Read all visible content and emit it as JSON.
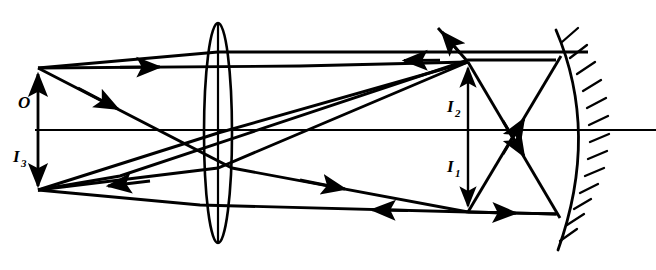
{
  "figure": {
    "kind": "optical-ray-diagram",
    "width": 656,
    "height": 270,
    "background_color": "#ffffff",
    "ink_color": "#000000"
  },
  "labels": [
    {
      "id": "object",
      "base": "O",
      "subscript": "",
      "x": 18,
      "y": 108,
      "description": "object arrow label above the optical axis at the far left"
    },
    {
      "id": "image3",
      "base": "I",
      "subscript": "3",
      "x": 13,
      "y": 162,
      "description": "final image label below the optical axis at the far left"
    },
    {
      "id": "image2",
      "base": "I",
      "subscript": "2",
      "x": 447,
      "y": 112,
      "description": "second image label above the optical axis near the mirror"
    },
    {
      "id": "image1",
      "base": "I",
      "subscript": "1",
      "x": 447,
      "y": 172,
      "description": "first image label below the optical axis near the mirror"
    }
  ],
  "optical_axis": {
    "name": "principal-axis",
    "x1": 35,
    "y1": 130,
    "x2": 656,
    "y2": 130
  },
  "lens": {
    "name": "converging-lens",
    "center_x": 218,
    "center_y": 133,
    "rx": 14,
    "ry": 110,
    "has_center_line": true,
    "shape": "biconvex"
  },
  "mirror": {
    "name": "concave-mirror",
    "shape": "arc",
    "path": "M 556 30 Q 600 133 558 250",
    "hatch_count": 13,
    "hatch_length": 15,
    "description": "concave mirror facing left, hatched on its back (right) side"
  },
  "elements": {
    "object_arrow": {
      "name": "object-arrow-O",
      "x": 38,
      "y_tail": 130,
      "y_tip": 68,
      "direction": "up"
    },
    "image3_arrow": {
      "name": "image-arrow-I3",
      "x": 38,
      "y_tail": 130,
      "y_tip": 190,
      "direction": "down"
    },
    "image2_arrow": {
      "name": "image-arrow-I2",
      "x": 468,
      "y_tail": 130,
      "y_tip": 62,
      "direction": "up"
    },
    "image1_arrow": {
      "name": "image-arrow-I1",
      "x": 468,
      "y_tail": 130,
      "y_tip": 212,
      "direction": "down"
    }
  },
  "rays": [
    {
      "name": "ray-parallel-incident-upper",
      "points": "38,68 468,62",
      "arrow_fracs": [
        0.22
      ],
      "note": "ray from object tip travelling right, parallel to axis, to mirror plane height"
    },
    {
      "name": "ray-through-lens-center-down",
      "points": "38,68 218,133 468,212",
      "arrow_fracs": [
        0.2,
        0.72
      ],
      "note": "undeviated ray through the lens centre forming I1 below the axis"
    },
    {
      "name": "ray-object-to-lens-top",
      "points": "38,68 218,52 588,52",
      "arrow_fracs": [],
      "note": "ray from object tip to the top of the lens then refracted parallel"
    },
    {
      "name": "ray-top-horizontal-return",
      "points": "588,52 218,52",
      "arrow_fracs": [],
      "note": "upper horizontal segment between lens and mirror"
    },
    {
      "name": "ray-mirror-reflect-upper-left",
      "points": "556,60 468,60 38,190",
      "arrow_fracs": [
        0.12,
        0.6
      ],
      "note": "ray reflected from mirror travelling left toward I3"
    },
    {
      "name": "ray-i1-to-mirror-upper",
      "points": "468,212 560,57",
      "arrow_fracs": [
        0.55
      ],
      "note": "ray from I1 up to the top of the mirror"
    },
    {
      "name": "ray-i2-to-mirror-lower",
      "points": "468,62 560,218",
      "arrow_fracs": [
        0.55
      ],
      "note": "ray from I2 down to the bottom of the mirror"
    },
    {
      "name": "ray-i1-horizontal-to-mirror",
      "points": "468,212 558,214",
      "arrow_fracs": [
        0.55
      ],
      "note": "horizontal ray from I1 to the mirror"
    },
    {
      "name": "ray-escape-upper-left",
      "points": "468,62 432,22",
      "arrow_fracs": [
        0.9
      ],
      "note": "ray continuing up and to the left past I2"
    },
    {
      "name": "ray-mirror-bottom-to-lens",
      "points": "556,214 218,216 38,190",
      "arrow_fracs": [
        0.62
      ],
      "note": "lower return ray from mirror through lens toward I3"
    },
    {
      "name": "ray-object-down-through-lens",
      "points": "38,130 218,133 468,62",
      "arrow_fracs": [],
      "note": "axial construction line"
    },
    {
      "name": "ray-object-base-up-right",
      "points": "38,68 232,168 468,212",
      "arrow_fracs": [
        0.16
      ],
      "note": "second construction ray from object tip sloping down-right"
    },
    {
      "name": "ray-return-to-i3",
      "points": "468,62 218,180 38,190",
      "arrow_fracs": [
        0.62
      ],
      "note": "returning ray refracted by the lens forming I3"
    }
  ]
}
